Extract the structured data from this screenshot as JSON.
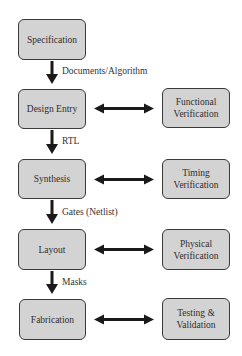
{
  "diagram": {
    "title": "",
    "main_flow": [
      {
        "id": "specification",
        "label": "Specification"
      },
      {
        "id": "design-entry",
        "label": "Design Entry"
      },
      {
        "id": "synthesis",
        "label": "Synthesis"
      },
      {
        "id": "layout",
        "label": "Layout"
      },
      {
        "id": "fabrication",
        "label": "Fabrication"
      }
    ],
    "flow_labels": [
      {
        "from": "specification",
        "to": "design-entry",
        "label": "Documents/Algorithm"
      },
      {
        "from": "design-entry",
        "to": "synthesis",
        "label": "RTL"
      },
      {
        "from": "synthesis",
        "to": "layout",
        "label": "Gates (Netlist)"
      },
      {
        "from": "layout",
        "to": "fabrication",
        "label": "Masks"
      }
    ],
    "verification": [
      {
        "id": "functional-verification",
        "label": "Functional\nVerification",
        "linked_to": "design-entry"
      },
      {
        "id": "timing-verification",
        "label": "Timing\nVerification",
        "linked_to": "synthesis"
      },
      {
        "id": "physical-verification",
        "label": "Physical\nVerification",
        "linked_to": "layout"
      },
      {
        "id": "testing-validation",
        "label": "Testing &\nValidation",
        "linked_to": "fabrication"
      }
    ],
    "colors": {
      "box_fill": "#d3d3d3",
      "box_border": "#3a3a3a",
      "arrow": "#1a1a1a",
      "text": "#333333"
    }
  }
}
